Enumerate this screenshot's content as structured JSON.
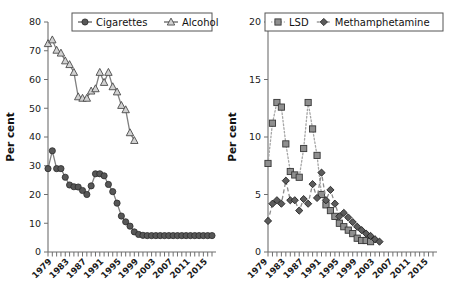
{
  "figure": {
    "background": "#ffffff",
    "panel_count": 2
  },
  "chart_data": [
    {
      "type": "line",
      "panel": "left",
      "title": "",
      "xlabel": "",
      "ylabel": "Per cent",
      "ylim": [
        0,
        80
      ],
      "yticks": [
        0,
        10,
        20,
        30,
        40,
        50,
        60,
        70,
        80
      ],
      "grid": false,
      "legend_position": "top-center",
      "x": [
        1978,
        1979,
        1980,
        1981,
        1982,
        1983,
        1984,
        1985,
        1986,
        1987,
        1988,
        1989,
        1990,
        1991,
        1992,
        1993,
        1994,
        1995,
        1996,
        1997,
        1998,
        1999,
        2000,
        2001,
        2002,
        2003,
        2004,
        2005,
        2006,
        2007,
        2008,
        2009,
        2010,
        2011,
        2012,
        2013,
        2014,
        2015,
        2016
      ],
      "xtick_labels": [
        "1979",
        "1983",
        "1987",
        "1991",
        "1995",
        "1999",
        "2003",
        "2007",
        "2011",
        "2015"
      ],
      "series": [
        {
          "name": "Cigarettes",
          "marker": "circle",
          "linestyle": "solid",
          "color": "#575757",
          "values": [
            29.0,
            35.2,
            29.0,
            29.0,
            26.0,
            23.3,
            22.7,
            22.6,
            21.4,
            20.0,
            23.0,
            27.2,
            27.2,
            26.5,
            23.5,
            21.0,
            17.0,
            12.5,
            10.5,
            9.0,
            7.0,
            6.1,
            5.8,
            5.7,
            5.7,
            5.7,
            5.7,
            5.7,
            5.7,
            5.7,
            5.7,
            5.7,
            5.7,
            5.7,
            5.7,
            5.7,
            5.7,
            5.7,
            5.7
          ]
        },
        {
          "name": "Alcohol",
          "marker": "triangle",
          "linestyle": "solid",
          "color": "#d2d2d2",
          "values": [
            72.5,
            73.8,
            70.2,
            69.2,
            66.5,
            65.2,
            62.5,
            54.0,
            53.5,
            53.5,
            56.0,
            56.8,
            62.5,
            59.0,
            62.5,
            57.5,
            55.7,
            51.0,
            49.5,
            41.5,
            38.8,
            null,
            null,
            null,
            null,
            null,
            null,
            null,
            null,
            null,
            null,
            null,
            null,
            null,
            null,
            null,
            null,
            null,
            null
          ]
        }
      ]
    },
    {
      "type": "line",
      "panel": "right",
      "title": "",
      "xlabel": "",
      "ylabel": "Per cent",
      "ylim": [
        0,
        20
      ],
      "yticks": [
        0,
        5,
        10,
        15,
        20
      ],
      "grid": false,
      "legend_position": "top-center",
      "x": [
        1979,
        1980,
        1981,
        1982,
        1983,
        1984,
        1985,
        1986,
        1987,
        1988,
        1989,
        1990,
        1991,
        1992,
        1993,
        1994,
        1995,
        1996,
        1997,
        1998,
        1999,
        2000,
        2001,
        2002,
        2003,
        2004,
        2005,
        2006,
        2007,
        2008,
        2009,
        2010,
        2011,
        2012,
        2013,
        2014,
        2015,
        2016
      ],
      "xtick_labels": [
        "1979",
        "1983",
        "1987",
        "1991",
        "1995",
        "1999",
        "2003",
        "2007",
        "2011",
        "2015"
      ],
      "series": [
        {
          "name": "LSD",
          "marker": "square",
          "linestyle": "dotted",
          "color": "#8f8f8f",
          "values": [
            7.7,
            11.2,
            13.0,
            12.6,
            9.4,
            7.0,
            6.7,
            6.5,
            9.0,
            13.0,
            10.7,
            8.4,
            5.0,
            4.1,
            3.6,
            3.1,
            2.5,
            2.2,
            1.9,
            1.6,
            1.2,
            1.0,
            1.0,
            0.9,
            null,
            null,
            null,
            null,
            null,
            null,
            null,
            null,
            null,
            null,
            null,
            null,
            null,
            null
          ]
        },
        {
          "name": "Methamphetamine",
          "marker": "diamond",
          "linestyle": "dashed",
          "color": "#5c5c5c",
          "values": [
            2.7,
            4.2,
            4.5,
            4.2,
            6.2,
            4.5,
            4.5,
            3.6,
            4.6,
            4.2,
            5.9,
            4.7,
            6.9,
            4.5,
            5.4,
            4.2,
            3.1,
            3.4,
            3.0,
            2.6,
            2.2,
            1.9,
            1.6,
            1.4,
            1.1,
            0.9,
            null,
            null,
            null,
            null,
            null,
            null,
            null,
            null,
            null,
            null,
            null,
            null
          ]
        }
      ]
    }
  ]
}
